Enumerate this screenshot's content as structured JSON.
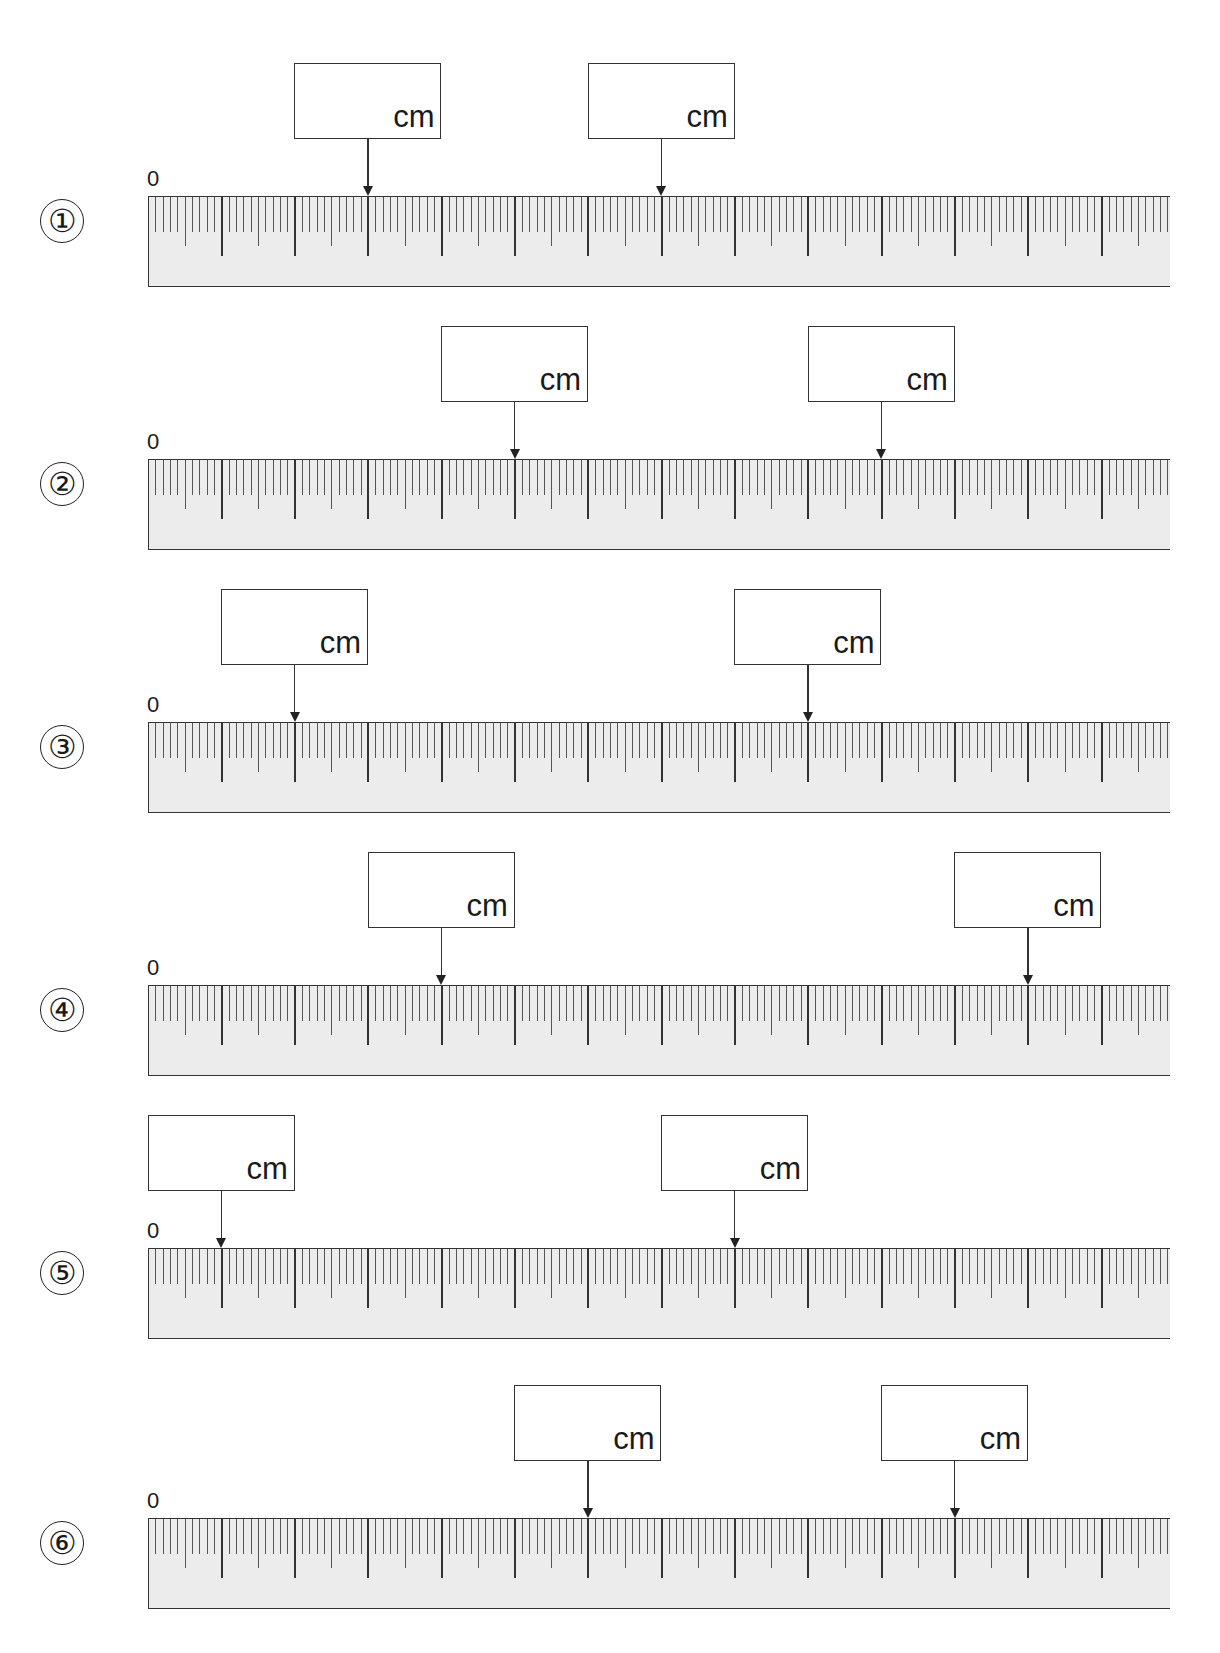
{
  "worksheet": {
    "unit_label": "cm",
    "zero_label": "0",
    "ruler": {
      "max_mm": 139,
      "px_per_mm": 7.333,
      "origin_x": 148,
      "height": 91
    },
    "problems": [
      {
        "number": "①",
        "ruler_top": 196,
        "markers_cm": [
          3,
          7
        ]
      },
      {
        "number": "②",
        "ruler_top": 459,
        "markers_cm": [
          5,
          10
        ]
      },
      {
        "number": "③",
        "ruler_top": 722,
        "markers_cm": [
          2,
          9
        ]
      },
      {
        "number": "④",
        "ruler_top": 985,
        "markers_cm": [
          4,
          12
        ]
      },
      {
        "number": "⑤",
        "ruler_top": 1248,
        "markers_cm": [
          1,
          8
        ]
      },
      {
        "number": "⑥",
        "ruler_top": 1518,
        "markers_cm": [
          6,
          11
        ]
      }
    ]
  },
  "colors": {
    "ruler_fill": "#ececec",
    "line": "#333333",
    "text": "#1a1a1a"
  }
}
